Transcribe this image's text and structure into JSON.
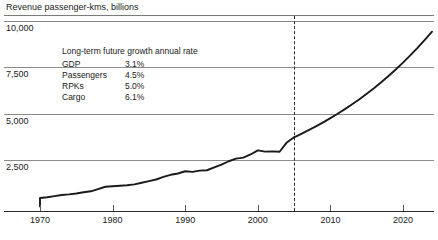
{
  "chart_data": {
    "type": "line",
    "title": "Revenue passenger-kms, billions",
    "xlabel": "",
    "ylabel": "Revenue passenger-kms, billions",
    "xlim": [
      1967,
      2024
    ],
    "ylim": [
      0,
      10000
    ],
    "ytick_labels": [
      "10,000",
      "7,500",
      "5,000",
      "2,500"
    ],
    "ytick_values": [
      10000,
      7500,
      5000,
      2500
    ],
    "xtick_labels": [
      "1970",
      "1980",
      "1990",
      "2000",
      "2010",
      "2020"
    ],
    "xtick_values": [
      1970,
      1980,
      1990,
      2000,
      2010,
      2020
    ],
    "grid": "horizontal",
    "legend": "none",
    "forecast_divider_year": 2005,
    "forecast_divider_style": "dashed",
    "series": [
      {
        "name": "Historical RPKs",
        "segment": "historical",
        "x": [
          1970,
          1971,
          1972,
          1973,
          1974,
          1975,
          1976,
          1977,
          1978,
          1979,
          1980,
          1981,
          1982,
          1983,
          1984,
          1985,
          1986,
          1987,
          1988,
          1989,
          1990,
          1991,
          1992,
          1993,
          1994,
          1995,
          1996,
          1997,
          1998,
          1999,
          2000,
          2001,
          2002,
          2003,
          2004,
          2005
        ],
        "values": [
          460,
          495,
          560,
          615,
          650,
          697,
          765,
          818,
          936,
          1060,
          1089,
          1119,
          1142,
          1190,
          1278,
          1367,
          1452,
          1589,
          1705,
          1774,
          1894,
          1860,
          1929,
          1949,
          2100,
          2248,
          2432,
          2573,
          2628,
          2797,
          3018,
          2950,
          2964,
          2942,
          3445,
          3720
        ]
      },
      {
        "name": "Forecast RPKs",
        "segment": "forecast",
        "x": [
          2005,
          2006,
          2007,
          2008,
          2009,
          2010,
          2011,
          2012,
          2013,
          2014,
          2015,
          2016,
          2017,
          2018,
          2019,
          2020,
          2021,
          2022,
          2023,
          2024
        ],
        "values": [
          3720,
          3906,
          4101,
          4306,
          4522,
          4748,
          4985,
          5234,
          5496,
          5771,
          6060,
          6363,
          6681,
          7015,
          7366,
          7734,
          8121,
          8527,
          8953,
          9401
        ]
      }
    ]
  },
  "rate_table": {
    "header": "Long-term future growth annual rate",
    "rows": [
      {
        "name": "GDP",
        "value": "3.1%"
      },
      {
        "name": "Passengers",
        "value": "4.5%"
      },
      {
        "name": "RPKs",
        "value": "5.0%"
      },
      {
        "name": "Cargo",
        "value": "6.1%"
      }
    ]
  },
  "colors": {
    "series": "#1a1a1a",
    "grid": "#8c8c8c",
    "axis": "#2a2a2a",
    "text": "#1a1a1a",
    "divider": "#2a2a2a"
  }
}
